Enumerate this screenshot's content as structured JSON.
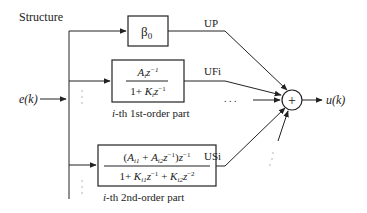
{
  "title": "Structure",
  "input_label": "e(k)",
  "output_label": "u(k)",
  "sum_symbol": "+",
  "blocks": {
    "proportional": {
      "label": "β0",
      "symbol": "β",
      "sub": "0",
      "signal": "UP"
    },
    "first_order": {
      "numerator": "A_i z^-1",
      "denominator": "1 + K_i z^-1",
      "signal": "UFi",
      "caption_italic": "i",
      "caption": "-th 1st-order part"
    },
    "second_order": {
      "numerator": "(A_i1 + A_i2 z^-1) z^-1",
      "denominator": "1 + K_i1 z^-1 + K_i2 z^-2",
      "signal": "USi",
      "caption_italic": "i",
      "caption": "-th 2nd-order part"
    }
  },
  "ellipsis": ". . ."
}
